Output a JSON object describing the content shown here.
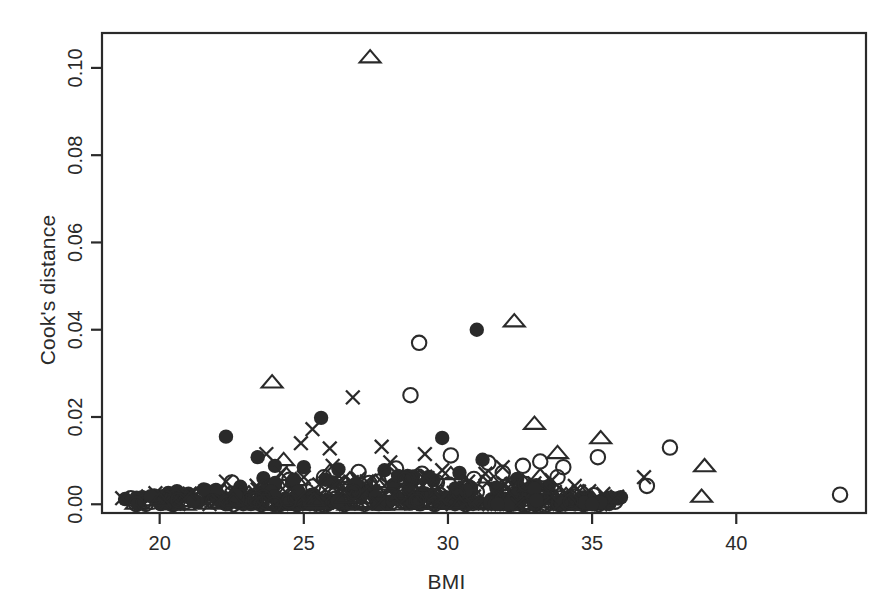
{
  "figure": {
    "background": "#ffffff",
    "ink_color": "#2a2a2a",
    "width": 893,
    "height": 616
  },
  "axes": {
    "y_label": "Cook's distance",
    "x_label": "BMI"
  },
  "chart_data": {
    "type": "scatter",
    "title": "",
    "xlabel": "BMI",
    "ylabel": "Cook's distance",
    "xlim": [
      18.0,
      44.5
    ],
    "ylim": [
      -0.002,
      0.108
    ],
    "xticks": [
      20,
      25,
      30,
      35,
      40
    ],
    "xtick_labels": [
      "20",
      "25",
      "30",
      "35",
      "40"
    ],
    "yticks": [
      0.0,
      0.02,
      0.04,
      0.06,
      0.08,
      0.1
    ],
    "ytick_labels": [
      "0.00",
      "0.02",
      "0.04",
      "0.06",
      "0.08",
      "0.10"
    ],
    "grid": false,
    "legend": false,
    "frame": "box",
    "marker_types": [
      "open-circle",
      "filled-circle",
      "open-triangle",
      "cross-x"
    ],
    "annotations": [
      {
        "text": "top outlier",
        "x": 27.3,
        "y": 0.1025,
        "marker": "open-triangle"
      }
    ],
    "series": [
      {
        "name": "open-triangle",
        "marker": "open-triangle",
        "points": [
          [
            27.3,
            0.1025
          ],
          [
            23.9,
            0.028
          ],
          [
            32.3,
            0.042
          ],
          [
            33.0,
            0.0185
          ],
          [
            35.3,
            0.0152
          ],
          [
            33.8,
            0.0118
          ],
          [
            38.9,
            0.0088
          ],
          [
            38.8,
            0.0018
          ],
          [
            24.3,
            0.0102
          ],
          [
            24.4,
            0.0068
          ],
          [
            23.6,
            0.004
          ],
          [
            25.9,
            0.0075
          ],
          [
            26.6,
            0.0058
          ],
          [
            27.4,
            0.004
          ],
          [
            28.3,
            0.006
          ],
          [
            29.0,
            0.0035
          ],
          [
            30.1,
            0.007
          ],
          [
            30.6,
            0.0048
          ],
          [
            31.4,
            0.0062
          ],
          [
            31.9,
            0.003
          ],
          [
            32.6,
            0.0052
          ],
          [
            33.2,
            0.0065
          ],
          [
            33.6,
            0.0042
          ],
          [
            34.1,
            0.0022
          ],
          [
            34.6,
            0.0028
          ],
          [
            35.0,
            0.0014
          ],
          [
            20.2,
            0.0018
          ],
          [
            21.3,
            0.0022
          ],
          [
            22.0,
            0.003
          ],
          [
            22.6,
            0.0012
          ],
          [
            23.1,
            0.0026
          ],
          [
            25.2,
            0.0018
          ],
          [
            26.1,
            0.0032
          ],
          [
            27.0,
            0.0015
          ],
          [
            28.0,
            0.0025
          ],
          [
            28.8,
            0.001
          ],
          [
            29.6,
            0.002
          ],
          [
            30.9,
            0.0016
          ],
          [
            31.6,
            0.0008
          ],
          [
            32.1,
            0.0038
          ],
          [
            24.8,
            0.0008
          ],
          [
            26.9,
            0.0006
          ],
          [
            29.3,
            0.0006
          ],
          [
            31.1,
            0.0004
          ],
          [
            33.9,
            0.0006
          ],
          [
            19.7,
            0.001
          ],
          [
            27.7,
            0.0046
          ],
          [
            30.3,
            0.0028
          ],
          [
            23.4,
            0.0012
          ],
          [
            25.5,
            0.0005
          ],
          [
            28.6,
            0.0044
          ],
          [
            32.9,
            0.0009
          ],
          [
            34.3,
            0.0008
          ],
          [
            22.9,
            0.0006
          ],
          [
            26.3,
            0.0011
          ]
        ]
      },
      {
        "name": "filled-circle",
        "marker": "filled-circle",
        "points": [
          [
            31.0,
            0.04
          ],
          [
            25.6,
            0.0198
          ],
          [
            22.3,
            0.0155
          ],
          [
            23.4,
            0.0108
          ],
          [
            29.8,
            0.0152
          ],
          [
            31.2,
            0.0102
          ],
          [
            25.0,
            0.0085
          ],
          [
            26.2,
            0.008
          ],
          [
            27.8,
            0.0078
          ],
          [
            24.0,
            0.0088
          ],
          [
            28.6,
            0.0065
          ],
          [
            30.4,
            0.0072
          ],
          [
            32.4,
            0.0058
          ],
          [
            33.5,
            0.0042
          ],
          [
            35.9,
            0.0014
          ],
          [
            36.0,
            0.0016
          ],
          [
            21.0,
            0.0024
          ],
          [
            20.8,
            0.002
          ],
          [
            20.3,
            0.0026
          ],
          [
            19.9,
            0.0018
          ],
          [
            21.6,
            0.0032
          ],
          [
            22.8,
            0.004
          ],
          [
            23.8,
            0.003
          ],
          [
            24.6,
            0.0048
          ],
          [
            25.3,
            0.0022
          ],
          [
            26.7,
            0.0036
          ],
          [
            27.2,
            0.0028
          ],
          [
            28.1,
            0.0044
          ],
          [
            29.2,
            0.0025
          ],
          [
            29.9,
            0.0015
          ],
          [
            30.8,
            0.0038
          ],
          [
            31.7,
            0.0018
          ],
          [
            32.8,
            0.0026
          ],
          [
            33.1,
            0.0012
          ],
          [
            34.0,
            0.0008
          ],
          [
            18.8,
            0.0012
          ],
          [
            19.4,
            0.0016
          ],
          [
            22.1,
            0.0008
          ],
          [
            23.0,
            0.0014
          ],
          [
            24.3,
            0.0006
          ],
          [
            25.8,
            0.001
          ],
          [
            27.5,
            0.0006
          ],
          [
            28.9,
            0.0009
          ],
          [
            30.0,
            0.0005
          ],
          [
            31.5,
            0.0011
          ],
          [
            32.2,
            0.0007
          ],
          [
            26.0,
            0.005
          ],
          [
            29.5,
            0.0055
          ],
          [
            20.6,
            0.003
          ],
          [
            21.9,
            0.0018
          ],
          [
            23.6,
            0.006
          ],
          [
            24.9,
            0.0014
          ],
          [
            27.0,
            0.002
          ],
          [
            30.6,
            0.0016
          ],
          [
            33.0,
            0.002
          ]
        ]
      },
      {
        "name": "open-circle",
        "marker": "open-circle",
        "points": [
          [
            29.0,
            0.037
          ],
          [
            28.7,
            0.025
          ],
          [
            37.7,
            0.013
          ],
          [
            35.2,
            0.0108
          ],
          [
            33.2,
            0.0098
          ],
          [
            34.0,
            0.0085
          ],
          [
            43.6,
            0.0022
          ],
          [
            36.9,
            0.0042
          ],
          [
            30.1,
            0.0112
          ],
          [
            31.4,
            0.0095
          ],
          [
            28.2,
            0.0082
          ],
          [
            26.9,
            0.0074
          ],
          [
            25.7,
            0.0062
          ],
          [
            24.5,
            0.0056
          ],
          [
            32.6,
            0.0088
          ],
          [
            33.8,
            0.0062
          ],
          [
            27.6,
            0.0052
          ],
          [
            29.4,
            0.0046
          ],
          [
            30.9,
            0.0058
          ],
          [
            32.0,
            0.004
          ],
          [
            23.9,
            0.0042
          ],
          [
            22.7,
            0.0026
          ],
          [
            21.4,
            0.002
          ],
          [
            20.1,
            0.0016
          ],
          [
            19.0,
            0.0014
          ],
          [
            24.1,
            0.0024
          ],
          [
            25.1,
            0.003
          ],
          [
            26.4,
            0.0018
          ],
          [
            27.1,
            0.0034
          ],
          [
            28.0,
            0.0012
          ],
          [
            29.7,
            0.0022
          ],
          [
            31.0,
            0.0028
          ],
          [
            31.8,
            0.0014
          ],
          [
            32.9,
            0.0032
          ],
          [
            34.4,
            0.0018
          ],
          [
            34.8,
            0.001
          ],
          [
            22.2,
            0.001
          ],
          [
            23.2,
            0.0008
          ],
          [
            25.4,
            0.0009
          ],
          [
            26.6,
            0.0006
          ],
          [
            28.4,
            0.0007
          ],
          [
            30.3,
            0.0009
          ],
          [
            33.4,
            0.0008
          ],
          [
            20.9,
            0.0006
          ],
          [
            27.9,
            0.0068
          ],
          [
            29.1,
            0.007
          ],
          [
            31.9,
            0.0072
          ],
          [
            30.5,
            0.0006
          ],
          [
            24.8,
            0.0013
          ],
          [
            26.1,
            0.0013
          ],
          [
            22.5,
            0.005
          ],
          [
            35.8,
            0.0006
          ]
        ]
      },
      {
        "name": "cross-x",
        "marker": "cross-x",
        "points": [
          [
            26.7,
            0.0245
          ],
          [
            25.3,
            0.0172
          ],
          [
            24.9,
            0.014
          ],
          [
            25.9,
            0.0128
          ],
          [
            27.7,
            0.0132
          ],
          [
            29.2,
            0.0115
          ],
          [
            23.7,
            0.0115
          ],
          [
            31.9,
            0.0085
          ],
          [
            33.0,
            0.0048
          ],
          [
            34.4,
            0.0042
          ],
          [
            36.8,
            0.0062
          ],
          [
            22.3,
            0.0052
          ],
          [
            24.2,
            0.0072
          ],
          [
            25.0,
            0.0062
          ],
          [
            26.0,
            0.0088
          ],
          [
            26.9,
            0.0058
          ],
          [
            28.0,
            0.0096
          ],
          [
            28.8,
            0.0064
          ],
          [
            29.8,
            0.0078
          ],
          [
            30.7,
            0.0052
          ],
          [
            31.3,
            0.007
          ],
          [
            32.2,
            0.0046
          ],
          [
            33.6,
            0.0055
          ],
          [
            34.9,
            0.003
          ],
          [
            18.7,
            0.0014
          ],
          [
            19.6,
            0.0018
          ],
          [
            20.5,
            0.0022
          ],
          [
            21.2,
            0.0016
          ],
          [
            22.0,
            0.0028
          ],
          [
            22.8,
            0.002
          ],
          [
            23.4,
            0.0034
          ],
          [
            24.0,
            0.0026
          ],
          [
            24.6,
            0.0038
          ],
          [
            25.6,
            0.0024
          ],
          [
            26.3,
            0.004
          ],
          [
            27.0,
            0.0018
          ],
          [
            27.4,
            0.003
          ],
          [
            28.4,
            0.0022
          ],
          [
            29.0,
            0.0036
          ],
          [
            29.6,
            0.0014
          ],
          [
            30.2,
            0.0026
          ],
          [
            30.9,
            0.0018
          ],
          [
            31.6,
            0.0032
          ],
          [
            32.6,
            0.0024
          ],
          [
            33.3,
            0.0016
          ],
          [
            34.1,
            0.0026
          ],
          [
            35.1,
            0.0012
          ],
          [
            21.8,
            0.0008
          ],
          [
            23.0,
            0.001
          ],
          [
            25.8,
            0.0008
          ],
          [
            28.2,
            0.0006
          ],
          [
            30.0,
            0.0008
          ],
          [
            32.0,
            0.0006
          ],
          [
            33.9,
            0.001
          ],
          [
            26.5,
            0.0005
          ],
          [
            29.4,
            0.0004
          ]
        ]
      }
    ]
  }
}
